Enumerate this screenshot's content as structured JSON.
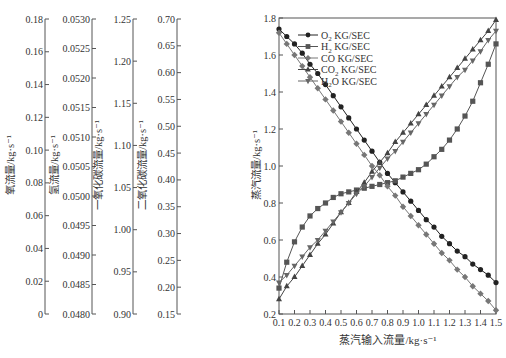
{
  "chart_data": {
    "type": "line",
    "title": "",
    "xlabel": "蒸汽输入流量/kg·s⁻¹",
    "x": [
      0.1,
      0.15,
      0.2,
      0.25,
      0.3,
      0.35,
      0.4,
      0.45,
      0.5,
      0.55,
      0.6,
      0.65,
      0.7,
      0.75,
      0.8,
      0.85,
      0.9,
      0.95,
      1.0,
      1.05,
      1.1,
      1.15,
      1.2,
      1.25,
      1.3,
      1.35,
      1.4,
      1.45,
      1.5
    ],
    "xlim": [
      0.1,
      1.5
    ],
    "xticks": [
      "0.1",
      "0.2",
      "0.3",
      "0.4",
      "0.5",
      "0.6",
      "0.7",
      "0.8",
      "0.9",
      "1.0",
      "1.1",
      "1.2",
      "1.3",
      "1.4",
      "1.5"
    ],
    "ylabel": "蒸汽流量/kg·s⁻¹",
    "ylim": [
      0.2,
      1.8
    ],
    "yticks": [
      "0.2",
      "0.4",
      "0.6",
      "0.8",
      "1.0",
      "1.2",
      "1.4",
      "1.6",
      "1.8"
    ],
    "grid": false,
    "legend_position": "upper center",
    "legend": [
      {
        "label_main": "O",
        "sub": "2",
        "label_rest": " KG/SEC",
        "marker": "circle"
      },
      {
        "label_main": "H",
        "sub": "2",
        "label_rest": " KG/SEC",
        "marker": "square"
      },
      {
        "label_main": "CO",
        "sub": "",
        "label_rest": "  KG/SEC",
        "marker": "diamond"
      },
      {
        "label_main": "CO",
        "sub": "2",
        "label_rest": " KG/SEC",
        "marker": "triangle-up"
      },
      {
        "label_main": "H",
        "sub": "2",
        "label_rest": "O KG/SEC",
        "marker": "triangle-down"
      }
    ],
    "series": [
      {
        "name": "O2 KG/SEC",
        "marker": "circle",
        "color": "#222222",
        "values": [
          1.74,
          1.7,
          1.66,
          1.61,
          1.55,
          1.5,
          1.44,
          1.38,
          1.32,
          1.26,
          1.2,
          1.14,
          1.08,
          1.02,
          0.96,
          0.91,
          0.86,
          0.81,
          0.76,
          0.71,
          0.67,
          0.62,
          0.58,
          0.54,
          0.51,
          0.47,
          0.44,
          0.41,
          0.37
        ]
      },
      {
        "name": "H2 KG/SEC",
        "marker": "square",
        "color": "#555555",
        "values": [
          0.34,
          0.48,
          0.59,
          0.67,
          0.73,
          0.77,
          0.8,
          0.83,
          0.85,
          0.86,
          0.87,
          0.88,
          0.89,
          0.9,
          0.91,
          0.92,
          0.94,
          0.96,
          0.98,
          1.01,
          1.05,
          1.09,
          1.14,
          1.2,
          1.27,
          1.35,
          1.45,
          1.55,
          1.66
        ]
      },
      {
        "name": "CO KG/SEC",
        "marker": "diamond",
        "color": "#777777",
        "values": [
          1.72,
          1.66,
          1.6,
          1.54,
          1.48,
          1.42,
          1.36,
          1.3,
          1.24,
          1.18,
          1.12,
          1.06,
          1.0,
          0.95,
          0.89,
          0.84,
          0.78,
          0.73,
          0.68,
          0.63,
          0.58,
          0.53,
          0.49,
          0.44,
          0.4,
          0.35,
          0.31,
          0.27,
          0.22
        ]
      },
      {
        "name": "CO2 KG/SEC",
        "marker": "triangle-up",
        "color": "#444444",
        "values": [
          0.28,
          0.35,
          0.4,
          0.46,
          0.52,
          0.58,
          0.63,
          0.69,
          0.75,
          0.8,
          0.86,
          0.91,
          0.97,
          1.02,
          1.07,
          1.13,
          1.18,
          1.23,
          1.28,
          1.33,
          1.38,
          1.43,
          1.48,
          1.53,
          1.58,
          1.63,
          1.68,
          1.73,
          1.79
        ]
      },
      {
        "name": "H2O KG/SEC",
        "marker": "triangle-down",
        "color": "#666666",
        "values": [
          0.37,
          0.41,
          0.46,
          0.51,
          0.56,
          0.6,
          0.65,
          0.7,
          0.75,
          0.8,
          0.85,
          0.89,
          0.94,
          0.99,
          1.04,
          1.08,
          1.13,
          1.18,
          1.23,
          1.28,
          1.33,
          1.38,
          1.43,
          1.48,
          1.52,
          1.57,
          1.62,
          1.68,
          1.73
        ]
      }
    ],
    "extra_y_axes": [
      {
        "label": "氧流量/kg·s⁻¹",
        "ylim": [
          0,
          0.18
        ],
        "ticks": [
          "0",
          "0.02",
          "0.04",
          "0.06",
          "0.08",
          "0.10",
          "0.12",
          "0.14",
          "0.16",
          "0.18"
        ]
      },
      {
        "label": "氢流量/kg·s⁻¹",
        "ylim": [
          0.048,
          0.053
        ],
        "ticks": [
          "0.0480",
          "0.0485",
          "0.0490",
          "0.0495",
          "0.0500",
          "0.0505",
          "0.0510",
          "0.0515",
          "0.0520",
          "0.0525",
          "0.0530"
        ]
      },
      {
        "label": "一氧化碳流量/kg·s⁻¹",
        "ylim": [
          0.9,
          1.25
        ],
        "ticks": [
          "0.90",
          "0.95",
          "1.00",
          "1.05",
          "1.10",
          "1.15",
          "1.20",
          "1.25"
        ]
      },
      {
        "label": "二氧化碳流量/kg·s⁻¹",
        "ylim": [
          0.15,
          0.7
        ],
        "ticks": [
          "0.15",
          "0.20",
          "0.25",
          "0.30",
          "0.35",
          "0.40",
          "0.45",
          "0.50",
          "0.55",
          "0.60",
          "0.65",
          "0.70"
        ]
      }
    ]
  }
}
